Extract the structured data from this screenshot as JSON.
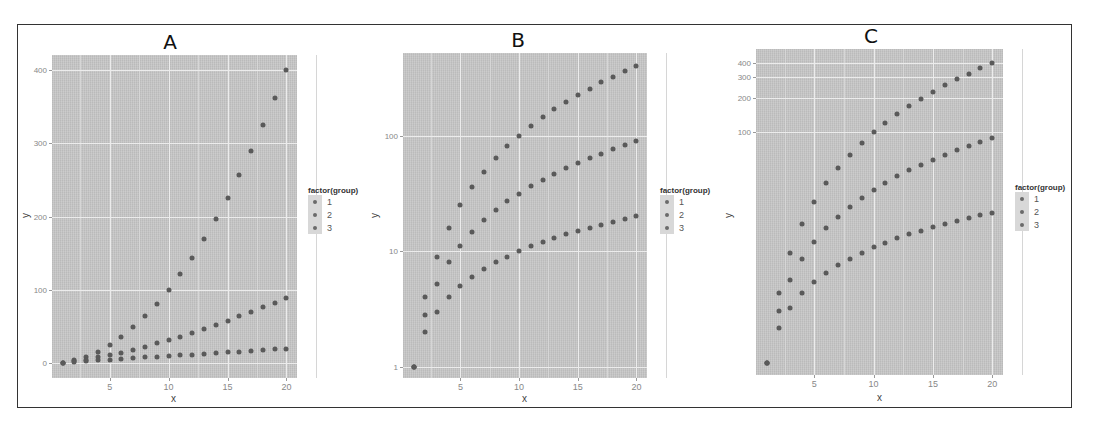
{
  "chart_data": [
    {
      "panel": "A",
      "type": "scatter",
      "title": "A",
      "xlabel": "x",
      "ylabel": "y",
      "yscale": "linear",
      "xticks": [
        5,
        10,
        15,
        20
      ],
      "yticks": [
        0,
        100,
        200,
        300,
        400
      ],
      "ytick_labels": [
        "0",
        "100",
        "200",
        "300",
        "400"
      ],
      "xlim": [
        0.1,
        20.9
      ],
      "ylim": [
        -20,
        420
      ],
      "grid": true,
      "legend": {
        "title": "factor(group)",
        "entries": [
          "1",
          "2",
          "3"
        ],
        "position": "right"
      },
      "x": [
        1,
        2,
        3,
        4,
        5,
        6,
        7,
        8,
        9,
        10,
        11,
        12,
        13,
        14,
        15,
        16,
        17,
        18,
        19,
        20
      ],
      "series": [
        {
          "name": "1",
          "values": [
            1,
            4,
            9,
            16,
            25,
            36,
            49,
            64,
            81,
            100,
            121,
            144,
            169,
            196,
            225,
            256,
            289,
            324,
            361,
            400
          ]
        },
        {
          "name": "2",
          "values": [
            1,
            2.8,
            5.2,
            8,
            11.2,
            14.7,
            18.5,
            22.6,
            27,
            31.6,
            36.5,
            41.6,
            46.9,
            52.4,
            58.1,
            64,
            70.1,
            76.4,
            82.8,
            89.4
          ]
        },
        {
          "name": "3",
          "values": [
            1,
            2,
            3,
            4,
            5,
            6,
            7,
            8,
            9,
            10,
            11,
            12,
            13,
            14,
            15,
            16,
            17,
            18,
            19,
            20
          ]
        }
      ]
    },
    {
      "panel": "B",
      "type": "scatter",
      "title": "B",
      "xlabel": "x",
      "ylabel": "y",
      "yscale": "log10",
      "xticks": [
        5,
        10,
        15,
        20
      ],
      "yticks": [
        1,
        10,
        100
      ],
      "ytick_labels": [
        "1",
        "10",
        "100"
      ],
      "xlim": [
        0.1,
        20.9
      ],
      "ylim": [
        0.8,
        520
      ],
      "grid": true,
      "legend": {
        "title": "factor(group)",
        "entries": [
          "1",
          "2",
          "3"
        ],
        "position": "right"
      },
      "x": [
        1,
        2,
        3,
        4,
        5,
        6,
        7,
        8,
        9,
        10,
        11,
        12,
        13,
        14,
        15,
        16,
        17,
        18,
        19,
        20
      ],
      "series": [
        {
          "name": "1",
          "values": [
            1,
            4,
            9,
            16,
            25,
            36,
            49,
            64,
            81,
            100,
            121,
            144,
            169,
            196,
            225,
            256,
            289,
            324,
            361,
            400
          ]
        },
        {
          "name": "2",
          "values": [
            1,
            2.8,
            5.2,
            8,
            11.2,
            14.7,
            18.5,
            22.6,
            27,
            31.6,
            36.5,
            41.6,
            46.9,
            52.4,
            58.1,
            64,
            70.1,
            76.4,
            82.8,
            89.4
          ]
        },
        {
          "name": "3",
          "values": [
            1,
            2,
            3,
            4,
            5,
            6,
            7,
            8,
            9,
            10,
            11,
            12,
            13,
            14,
            15,
            16,
            17,
            18,
            19,
            20
          ]
        }
      ]
    },
    {
      "panel": "C",
      "type": "scatter",
      "title": "C",
      "xlabel": "x",
      "ylabel": "y",
      "yscale": "log10",
      "xticks": [
        5,
        10,
        15,
        20
      ],
      "yticks": [
        100,
        200,
        300,
        400
      ],
      "ytick_labels": [
        "100",
        "200",
        "300",
        "400"
      ],
      "xlim": [
        0.1,
        20.9
      ],
      "ylim": [
        0.78,
        530
      ],
      "grid": true,
      "legend": {
        "title": "factor(group)",
        "entries": [
          "1",
          "2",
          "3"
        ],
        "position": "right"
      },
      "x": [
        1,
        2,
        3,
        4,
        5,
        6,
        7,
        8,
        9,
        10,
        11,
        12,
        13,
        14,
        15,
        16,
        17,
        18,
        19,
        20
      ],
      "series": [
        {
          "name": "1",
          "values": [
            1,
            4,
            9,
            16,
            25,
            36,
            49,
            64,
            81,
            100,
            121,
            144,
            169,
            196,
            225,
            256,
            289,
            324,
            361,
            400
          ]
        },
        {
          "name": "2",
          "values": [
            1,
            2.8,
            5.2,
            8,
            11.2,
            14.7,
            18.5,
            22.6,
            27,
            31.6,
            36.5,
            41.6,
            46.9,
            52.4,
            58.1,
            64,
            70.1,
            76.4,
            82.8,
            89.4
          ]
        },
        {
          "name": "3",
          "values": [
            1,
            2,
            3,
            4,
            5,
            6,
            7,
            8,
            9,
            10,
            11,
            12,
            13,
            14,
            15,
            16,
            17,
            18,
            19,
            20
          ]
        }
      ]
    }
  ],
  "panels": {
    "A": {
      "title": "A",
      "xlabel": "x",
      "ylabel": "y",
      "legend_title": "factor(group)",
      "legend_items": [
        "1",
        "2",
        "3"
      ]
    },
    "B": {
      "title": "B",
      "xlabel": "x",
      "ylabel": "y",
      "legend_title": "factor(group)",
      "legend_items": [
        "1",
        "2",
        "3"
      ]
    },
    "C": {
      "title": "C",
      "xlabel": "x",
      "ylabel": "y",
      "legend_title": "factor(group)",
      "legend_items": [
        "1",
        "2",
        "3"
      ]
    }
  },
  "colors": {
    "plot_background": "#c6c6c6",
    "gridline": "#ececec",
    "point": "#5a5a5a",
    "frame": "#333333"
  }
}
